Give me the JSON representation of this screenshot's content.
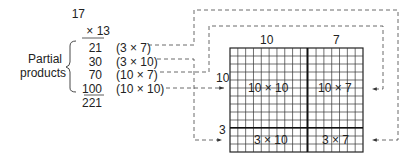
{
  "multiplication": {
    "multiplicand": "17",
    "multiplier": "× 13",
    "partial_products_label": [
      "Partial",
      "products"
    ],
    "rows": [
      {
        "value": "21",
        "expression": "(3 × 7)"
      },
      {
        "value": "30",
        "expression": "(3 × 10)"
      },
      {
        "value": "70",
        "expression": "(10 × 7)"
      },
      {
        "value": "100",
        "expression": "(10 × 10)"
      }
    ],
    "total": "221"
  },
  "area_model": {
    "column_labels": [
      "10",
      "7"
    ],
    "row_labels": [
      "10",
      "3"
    ],
    "cells": [
      {
        "label": "10 × 10"
      },
      {
        "label": "10 × 7"
      },
      {
        "label": "3 × 10"
      },
      {
        "label": "3 × 7"
      }
    ]
  }
}
